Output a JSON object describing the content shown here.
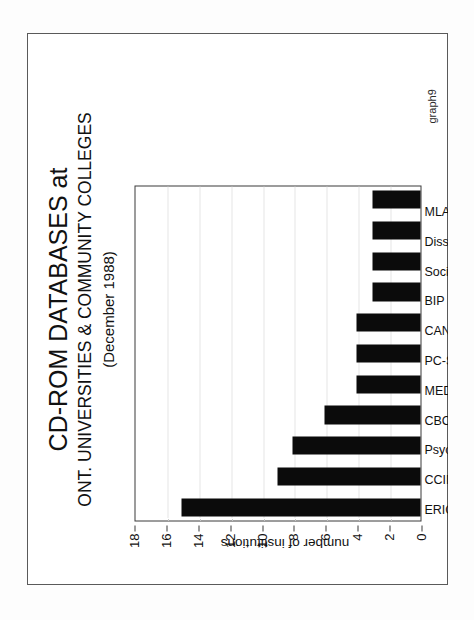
{
  "document": {
    "annotation": "graph9"
  },
  "chart_data": {
    "type": "bar",
    "orientation": "vertical-in-figure-space",
    "title": "CD-ROM DATABASES at",
    "subtitle": "ONT. UNIVERSITIES & COMMUNITY COLLEGES",
    "date_note": "(December 1988)",
    "xlabel": "",
    "ylabel": "number of institutions",
    "ylim": [
      0,
      18
    ],
    "yticks": [
      0,
      2,
      4,
      6,
      8,
      10,
      12,
      14,
      16,
      18
    ],
    "grid": true,
    "legend": "none",
    "bar_color": "#0b0b0b",
    "categories": [
      "ERIC",
      "CCINFO",
      "PsycLIT",
      "CBCA",
      "MEDLINE",
      "PC-SIG",
      "CANSIM/CENSUS",
      "BIP Plus",
      "Sociofile",
      "Dissertation Abs.",
      "MLA Bibliography"
    ],
    "values": [
      15,
      9,
      8,
      6,
      4,
      4,
      4,
      3,
      3,
      3,
      3
    ]
  }
}
